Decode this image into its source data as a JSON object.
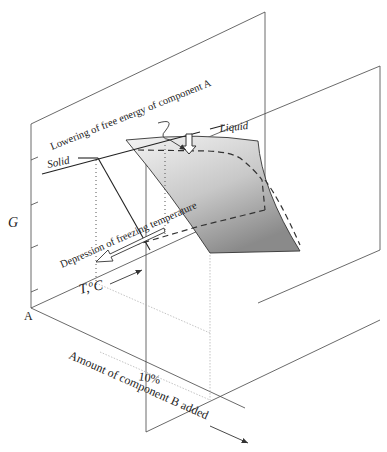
{
  "diagram": {
    "type": "3d-free-energy-schematic",
    "labels": {
      "lowering": "Lowering of free energy of component A",
      "solid": "Solid",
      "liquid": "Liquid",
      "g_axis": "G",
      "depression": "Depression of freezing temperature",
      "temp_axis": "T, °C",
      "temp_T": "T,",
      "temp_unit_o": "o",
      "temp_unit_C": "C",
      "origin": "A",
      "ten_percent": "10%",
      "amount_axis": "Amount of component B added"
    },
    "colors": {
      "line": "#333333",
      "surface_light": "#f0f0f0",
      "surface_dark": "#8a8a8a"
    }
  }
}
